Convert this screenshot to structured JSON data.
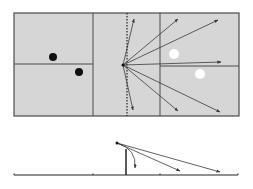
{
  "colors": {
    "panel_fill": "#d6d6d6",
    "line": "#4a4a4a",
    "arrow": "#3a3a3a",
    "black_dot": "#111111",
    "white_dot": "#ffffff",
    "background": "#ffffff"
  },
  "top_view": {
    "frame": {
      "x": 14,
      "y": 13,
      "w": 225,
      "h": 103
    },
    "divider_left_x": 93,
    "divider_right_x": 160,
    "mirror_dotted_x": 127,
    "left_horizontal_y": 64,
    "right_horizontal_y": 66,
    "origin": {
      "x": 123,
      "y": 65
    },
    "black_dots": [
      {
        "x": 53,
        "y": 57
      },
      {
        "x": 79,
        "y": 72
      }
    ],
    "white_dots": [
      {
        "x": 174,
        "y": 54
      },
      {
        "x": 200,
        "y": 74
      }
    ],
    "arrows": [
      {
        "x": 134,
        "y": 19
      },
      {
        "x": 178,
        "y": 19
      },
      {
        "x": 218,
        "y": 20
      },
      {
        "x": 221,
        "y": 62
      },
      {
        "x": 220,
        "y": 112
      },
      {
        "x": 178,
        "y": 111
      },
      {
        "x": 133,
        "y": 110
      }
    ]
  },
  "side_view": {
    "baseline": {
      "x1": 14,
      "x2": 238,
      "y": 175
    },
    "ticks_x": [
      14,
      93,
      160,
      238
    ],
    "post": {
      "x": 126,
      "y_top": 149,
      "y_bottom": 175
    },
    "origin": {
      "x": 117,
      "y": 143
    },
    "arrows": [
      {
        "type": "curved",
        "x": 135,
        "y": 168
      },
      {
        "type": "straight",
        "x": 180,
        "y": 171
      },
      {
        "type": "straight",
        "x": 220,
        "y": 172
      }
    ]
  }
}
